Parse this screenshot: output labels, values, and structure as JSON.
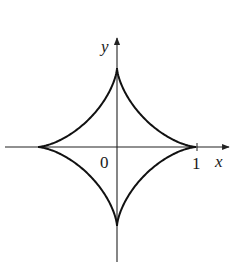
{
  "figure": {
    "type": "astroid",
    "equation": "x^(2/3) + y^(2/3) = 1",
    "axes": {
      "x_label": "x",
      "y_label": "y",
      "origin_label": "0",
      "tick_labels": [
        "1"
      ]
    },
    "colors": {
      "curve": "#111111",
      "axes": "#222222",
      "background": "#ffffff"
    }
  }
}
